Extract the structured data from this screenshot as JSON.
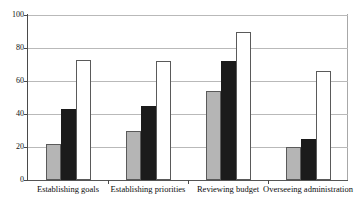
{
  "chart_data": {
    "type": "bar",
    "title": "Board Performance",
    "title_clipped": true,
    "xlabel": "",
    "ylabel": "",
    "ylim": [
      0,
      100
    ],
    "yticks": [
      0,
      20,
      40,
      60,
      80,
      100
    ],
    "ytick_labels": [
      "0",
      "20",
      "40",
      "60",
      "80",
      "100"
    ],
    "grid": true,
    "grid_axis": "y",
    "legend": false,
    "legend_position": "none",
    "categories": [
      "Establishing goals",
      "Establishing priorities",
      "Reviewing budget",
      "Overseeing administration"
    ],
    "series": [
      {
        "name": "series-1",
        "color": "#b5b5b5",
        "values": [
          22,
          30,
          54,
          20
        ]
      },
      {
        "name": "series-2",
        "color": "#1b1b1b",
        "values": [
          43,
          45,
          72,
          25
        ]
      },
      {
        "name": "series-3",
        "color": "#ffffff",
        "values": [
          73,
          72,
          90,
          66
        ]
      }
    ]
  },
  "colors": {
    "series_light_gray": "#b5b5b5",
    "series_black": "#1b1b1b",
    "series_white": "#ffffff",
    "gridline": "#b9b9b9",
    "axis": "#4a4a4a",
    "background": "#ffffff",
    "text": "#0d0d0d"
  }
}
